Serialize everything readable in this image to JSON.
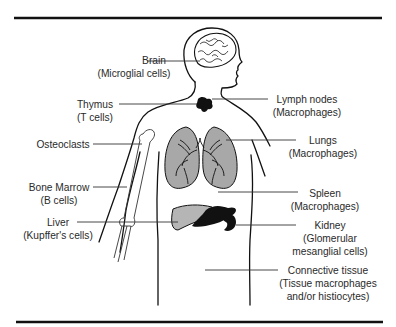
{
  "figure": {
    "labels": [
      {
        "id": "brain",
        "organ": "Brain",
        "cell": "(Microglial cells)"
      },
      {
        "id": "thymus",
        "organ": "Thymus",
        "cell": "(T cells)"
      },
      {
        "id": "osteoclasts",
        "organ": "Osteoclasts",
        "cell": ""
      },
      {
        "id": "bone-marrow",
        "organ": "Bone Marrow",
        "cell": "(B cells)"
      },
      {
        "id": "liver",
        "organ": "Liver",
        "cell": "(Kupffer's cells)"
      },
      {
        "id": "lymph-nodes",
        "organ": "Lymph nodes",
        "cell": "(Macrophages)"
      },
      {
        "id": "lungs",
        "organ": "Lungs",
        "cell": "(Macrophages)"
      },
      {
        "id": "spleen",
        "organ": "Spleen",
        "cell": "(Macrophages)"
      },
      {
        "id": "kidney",
        "organ": "Kidney",
        "cell": "(Glomerular",
        "cell2": "mesanglial cells)"
      },
      {
        "id": "connective-tissue",
        "organ": "Connective tissue",
        "cell": "(Tissue macrophages",
        "cell2": "and/or histiocytes)"
      }
    ],
    "colors": {
      "ink": "#111111",
      "lung_fill": "#a8a8a8",
      "liver_fill": "#b5b5b5",
      "dark_organ": "#111111"
    }
  }
}
